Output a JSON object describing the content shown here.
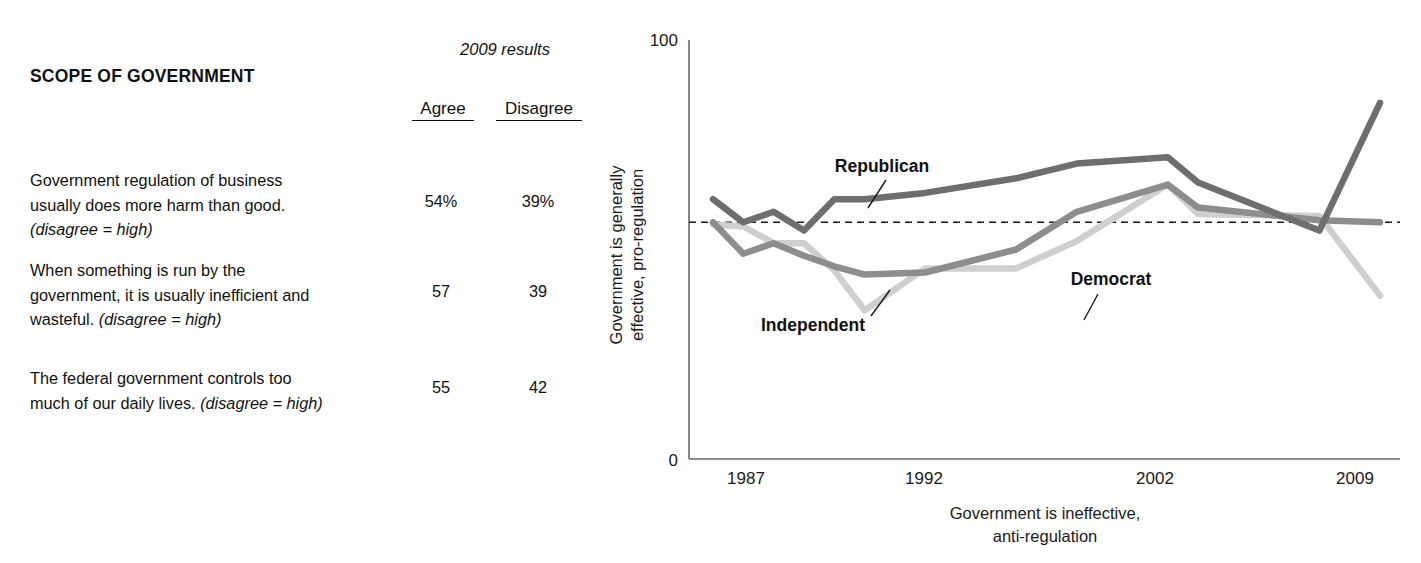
{
  "table": {
    "section_title": "SCOPE OF GOVERNMENT",
    "results_caption": "2009 results",
    "columns": [
      "Agree",
      "Disagree"
    ],
    "rows": [
      {
        "statement_line1": "Government regulation of business",
        "statement_line2": "usually does more harm than good.",
        "statement_line3_note": "(disagree = high)",
        "agree": "54%",
        "disagree": "39%"
      },
      {
        "statement_line1": "When something is run by the",
        "statement_line2": "government, it is usually inefficient and",
        "statement_line3": "wasteful. ",
        "statement_line3_note": "(disagree = high)",
        "agree": "57",
        "disagree": "39"
      },
      {
        "statement_line1": "The federal government controls too",
        "statement_line2": "much of our daily lives. ",
        "statement_line2_note": "(disagree = high)",
        "agree": "55",
        "disagree": "42"
      }
    ]
  },
  "chart_data": {
    "type": "line",
    "title": "",
    "xlabel": "Government is ineffective, anti-regulation",
    "xlabel_line1": "Government is ineffective,",
    "xlabel_line2": "anti-regulation",
    "ylabel": "Government is generally effective, pro-regulation",
    "ylabel_line1": "Government is generally",
    "ylabel_line2": "effective, pro-regulation",
    "ylim": [
      0,
      100
    ],
    "ytick_labels": [
      "0",
      "100"
    ],
    "xtick_labels": [
      "1987",
      "1992",
      "2002",
      "2009"
    ],
    "grid": false,
    "legend_position": "inline-annotations",
    "reference_line_y": 56.5,
    "x": [
      1987,
      1988,
      1989,
      1990,
      1991,
      1992,
      1994,
      1997,
      1999,
      2002,
      2003,
      2007,
      2009
    ],
    "series": [
      {
        "name": "Republican",
        "color": "#6e6e6e",
        "values": [
          62,
          56.5,
          59,
          54.5,
          62,
          62,
          63.5,
          67,
          70.5,
          72,
          66,
          54.5,
          85
        ]
      },
      {
        "name": "Democrat",
        "color": "#8d8d8d",
        "values": [
          56.5,
          49,
          51.5,
          48.5,
          46,
          44,
          44.5,
          50,
          59,
          65.5,
          60,
          57,
          56.5
        ]
      },
      {
        "name": "Independent",
        "color": "#cfcfcf",
        "values": [
          56,
          55.5,
          51.5,
          51.5,
          45,
          35.5,
          45.5,
          45.5,
          52,
          65.5,
          58.5,
          58,
          39
        ]
      }
    ]
  },
  "colors": {
    "republican": "#6e6e6e",
    "democrat": "#8d8d8d",
    "independent": "#cfcfcf",
    "axis": "#6a6a6a",
    "text": "#1a1a1a"
  }
}
